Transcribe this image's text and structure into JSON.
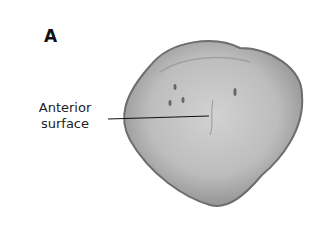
{
  "figure": {
    "panel_label": "A",
    "callout": {
      "line1": "Anterior",
      "line2": "surface"
    },
    "colors": {
      "bone_fill": "#b9b9b9",
      "bone_edge": "#6e6e6e",
      "leader": "#111111"
    }
  }
}
